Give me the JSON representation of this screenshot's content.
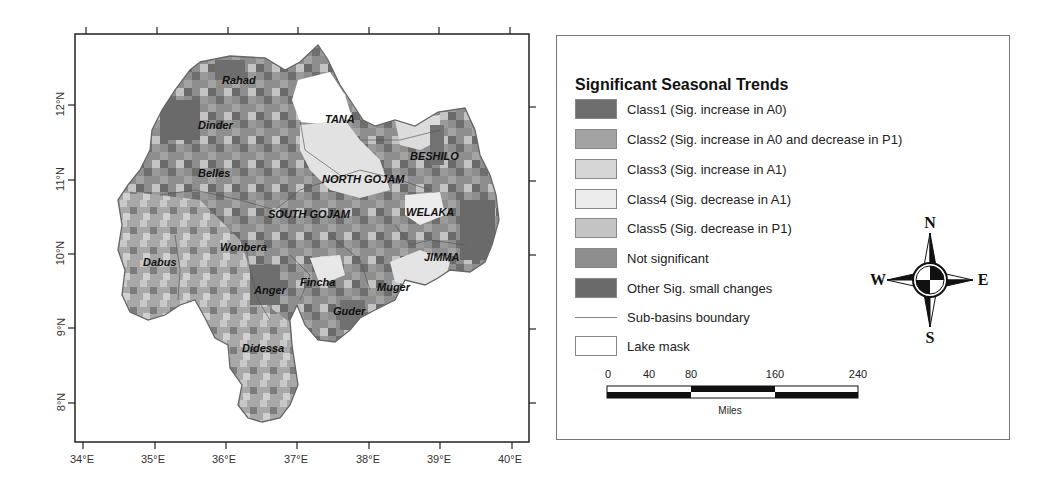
{
  "map": {
    "longitude_ticks": [
      "34°E",
      "35°E",
      "36°E",
      "37°E",
      "38°E",
      "39°E",
      "40°E"
    ],
    "latitude_ticks": [
      "12°N",
      "11°N",
      "10°N",
      "9°N",
      "8°N"
    ],
    "basin_labels": [
      {
        "name": "Rahad",
        "x": 222,
        "y": 74
      },
      {
        "name": "Dinder",
        "x": 198,
        "y": 119
      },
      {
        "name": "TANA",
        "x": 325,
        "y": 113
      },
      {
        "name": "BESHILO",
        "x": 410,
        "y": 150
      },
      {
        "name": "Belles",
        "x": 198,
        "y": 167
      },
      {
        "name": "NORTH GOJAM",
        "x": 322,
        "y": 173
      },
      {
        "name": "SOUTH GOJAM",
        "x": 268,
        "y": 208
      },
      {
        "name": "WELAKA",
        "x": 406,
        "y": 206
      },
      {
        "name": "Wonbera",
        "x": 220,
        "y": 241
      },
      {
        "name": "JIMMA",
        "x": 424,
        "y": 251
      },
      {
        "name": "Dabus",
        "x": 143,
        "y": 256
      },
      {
        "name": "Fincha",
        "x": 300,
        "y": 276
      },
      {
        "name": "Anger",
        "x": 254,
        "y": 284
      },
      {
        "name": "Muger",
        "x": 377,
        "y": 281
      },
      {
        "name": "Guder",
        "x": 333,
        "y": 305
      },
      {
        "name": "Didessa",
        "x": 242,
        "y": 342
      }
    ]
  },
  "legend": {
    "title": "Significant Seasonal Trends",
    "items": [
      {
        "label": "Class1 (Sig. increase in A0)",
        "color": "#6e6e6e",
        "type": "fill"
      },
      {
        "label": "Class2 (Sig. increase in A0 and decrease in P1)",
        "color": "#a3a3a3",
        "type": "fill"
      },
      {
        "label": "Class3 (Sig. increase in A1)",
        "color": "#d6d6d6",
        "type": "fill"
      },
      {
        "label": "Class4 (Sig. decrease in A1)",
        "color": "#ececec",
        "type": "fill"
      },
      {
        "label": "Class5 (Sig. decrease in P1)",
        "color": "#c4c4c4",
        "type": "fill"
      },
      {
        "label": "Not significant",
        "color": "#8e8e8e",
        "type": "fill"
      },
      {
        "label": "Other Sig. small changes",
        "color": "#6a6a6a",
        "type": "fill"
      },
      {
        "label": "Sub-basins boundary",
        "color": "#888888",
        "type": "line"
      },
      {
        "label": "Lake mask",
        "color": "#ffffff",
        "type": "fill"
      }
    ]
  },
  "compass": {
    "n": "N",
    "s": "S",
    "e": "E",
    "w": "W"
  },
  "scale_bar": {
    "ticks": [
      "0",
      "40",
      "80",
      "160",
      "240"
    ],
    "unit": "Miles"
  }
}
